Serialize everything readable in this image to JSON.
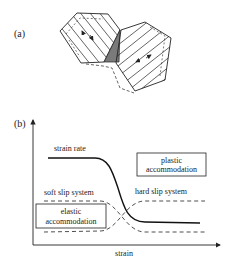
{
  "panel_a": {
    "label": "(a)",
    "description": "Two hexagonal grains with parallel slip lines and arrows indicating slip, separated by a shaded wedge; dashed outline indicates deformed shape"
  },
  "panel_b": {
    "label": "(b)",
    "x_axis_label": "strain",
    "curve_labels": {
      "strain_rate": "strain rate",
      "soft_slip": "soft slip system",
      "hard_slip": "hard slip system"
    },
    "boxes": {
      "plastic": [
        "plastic",
        "accommodation"
      ],
      "elastic": [
        "elastic",
        "accommodation"
      ]
    }
  },
  "colors": {
    "line": "#222222",
    "wedge": "#7a7a7a"
  }
}
